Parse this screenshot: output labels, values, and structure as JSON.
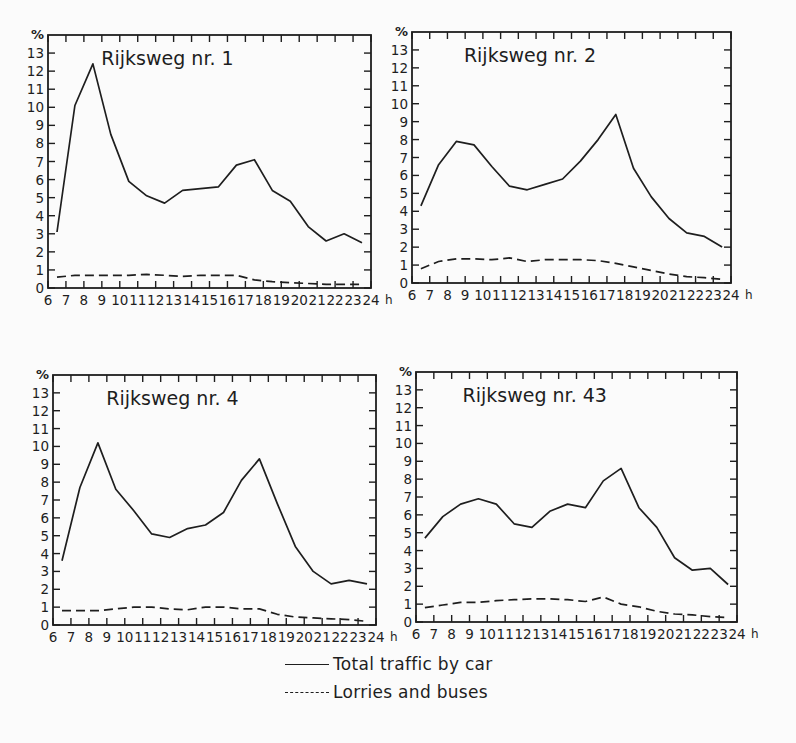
{
  "chart_data": [
    {
      "type": "line",
      "title": "Rijksweg nr. 1",
      "xlabel": "h",
      "ylabel": "%",
      "x_ticks": [
        6,
        7,
        8,
        9,
        10,
        11,
        12,
        13,
        14,
        15,
        16,
        17,
        18,
        19,
        20,
        21,
        22,
        23,
        24
      ],
      "y_ticks": [
        0,
        1,
        2,
        3,
        4,
        5,
        6,
        7,
        8,
        9,
        10,
        11,
        12,
        13
      ],
      "xlim": [
        6,
        24
      ],
      "ylim": [
        0,
        14
      ],
      "x": [
        6.5,
        7.5,
        8.5,
        9.5,
        10.5,
        11.5,
        12.5,
        13.5,
        14.5,
        15.5,
        16.5,
        17.5,
        18.5,
        19.5,
        20.5,
        21.5,
        22.5,
        23.5
      ],
      "series": [
        {
          "name": "Total traffic by car",
          "style": "solid",
          "values": [
            3.1,
            10.1,
            12.4,
            8.5,
            5.9,
            5.1,
            4.7,
            5.4,
            5.5,
            5.6,
            6.8,
            7.1,
            5.4,
            4.8,
            3.4,
            2.6,
            3.0,
            2.5
          ]
        },
        {
          "name": "Lorries and buses",
          "style": "dashed",
          "values": [
            0.6,
            0.7,
            0.7,
            0.7,
            0.7,
            0.75,
            0.7,
            0.65,
            0.7,
            0.7,
            0.7,
            0.45,
            0.35,
            0.3,
            0.25,
            0.2,
            0.2,
            0.2
          ]
        }
      ],
      "frame": {
        "left": 48,
        "top": 35,
        "right": 371,
        "bottom": 288
      }
    },
    {
      "type": "line",
      "title": "Rijksweg nr. 2",
      "xlabel": "h",
      "ylabel": "%",
      "x_ticks": [
        6,
        7,
        8,
        9,
        10,
        11,
        12,
        13,
        14,
        15,
        16,
        17,
        18,
        19,
        20,
        21,
        22,
        23,
        24
      ],
      "y_ticks": [
        0,
        1,
        2,
        3,
        4,
        5,
        6,
        7,
        8,
        9,
        10,
        11,
        12,
        13
      ],
      "xlim": [
        6,
        24
      ],
      "ylim": [
        0,
        14
      ],
      "x": [
        6.5,
        7.5,
        8.5,
        9.5,
        10.5,
        11.5,
        12.5,
        13.5,
        14.5,
        15.5,
        16.5,
        17.5,
        18.5,
        19.5,
        20.5,
        21.5,
        22.5,
        23.5
      ],
      "series": [
        {
          "name": "Total traffic by car",
          "style": "solid",
          "values": [
            4.3,
            6.6,
            7.9,
            7.7,
            6.5,
            5.4,
            5.2,
            5.5,
            5.8,
            6.8,
            8.0,
            9.4,
            6.4,
            4.8,
            3.6,
            2.8,
            2.6,
            2.0
          ]
        },
        {
          "name": "Lorries and buses",
          "style": "dashed",
          "values": [
            0.8,
            1.2,
            1.35,
            1.35,
            1.3,
            1.4,
            1.2,
            1.3,
            1.3,
            1.3,
            1.25,
            1.1,
            0.9,
            0.7,
            0.5,
            0.35,
            0.3,
            0.2
          ]
        }
      ],
      "frame": {
        "left": 412,
        "top": 32,
        "right": 731,
        "bottom": 283
      }
    },
    {
      "type": "line",
      "title": "Rijksweg nr. 4",
      "xlabel": "h",
      "ylabel": "%",
      "x_ticks": [
        6,
        7,
        8,
        9,
        10,
        11,
        12,
        13,
        14,
        15,
        16,
        17,
        18,
        19,
        20,
        21,
        22,
        23,
        24
      ],
      "y_ticks": [
        0,
        1,
        2,
        3,
        4,
        5,
        6,
        7,
        8,
        9,
        10,
        11,
        12,
        13
      ],
      "xlim": [
        6,
        24
      ],
      "ylim": [
        0,
        14
      ],
      "x": [
        6.5,
        7.5,
        8.5,
        9.5,
        10.5,
        11.5,
        12.5,
        13.5,
        14.5,
        15.5,
        16.5,
        17.5,
        18.5,
        19.5,
        20.5,
        21.5,
        22.5,
        23.5
      ],
      "series": [
        {
          "name": "Total traffic by car",
          "style": "solid",
          "values": [
            3.6,
            7.7,
            10.2,
            7.6,
            6.4,
            5.1,
            4.9,
            5.4,
            5.6,
            6.3,
            8.1,
            9.3,
            6.8,
            4.4,
            3.0,
            2.3,
            2.5,
            2.3
          ]
        },
        {
          "name": "Lorries and buses",
          "style": "dashed",
          "values": [
            0.8,
            0.8,
            0.8,
            0.9,
            1.0,
            1.0,
            0.9,
            0.85,
            1.0,
            1.0,
            0.9,
            0.9,
            0.6,
            0.45,
            0.4,
            0.35,
            0.3,
            0.2
          ]
        }
      ],
      "frame": {
        "left": 53,
        "top": 375,
        "right": 376,
        "bottom": 625
      }
    },
    {
      "type": "line",
      "title": "Rijksweg nr.  43",
      "xlabel": "h",
      "ylabel": "%",
      "x_ticks": [
        6,
        7,
        8,
        9,
        10,
        11,
        12,
        13,
        14,
        15,
        16,
        17,
        18,
        19,
        20,
        21,
        22,
        23,
        24
      ],
      "y_ticks": [
        0,
        1,
        2,
        3,
        4,
        5,
        6,
        7,
        8,
        9,
        10,
        11,
        12,
        13
      ],
      "xlim": [
        6,
        24
      ],
      "ylim": [
        0,
        14
      ],
      "x": [
        6.5,
        7.5,
        8.5,
        9.5,
        10.5,
        11.5,
        12.5,
        13.5,
        14.5,
        15.5,
        16.5,
        17.5,
        18.5,
        19.5,
        20.5,
        21.5,
        22.5,
        23.5
      ],
      "series": [
        {
          "name": "Total traffic by car",
          "style": "solid",
          "values": [
            4.7,
            5.9,
            6.6,
            6.9,
            6.6,
            5.5,
            5.3,
            6.2,
            6.6,
            6.4,
            7.9,
            8.6,
            6.4,
            5.3,
            3.6,
            2.9,
            3.0,
            2.1
          ]
        },
        {
          "name": "Lorries and buses",
          "style": "dashed",
          "values": [
            0.8,
            0.95,
            1.1,
            1.1,
            1.2,
            1.25,
            1.3,
            1.3,
            1.25,
            1.15,
            1.4,
            1.0,
            0.85,
            0.6,
            0.45,
            0.4,
            0.3,
            0.25
          ]
        }
      ],
      "frame": {
        "left": 416,
        "top": 372,
        "right": 737,
        "bottom": 622
      }
    }
  ],
  "legend": {
    "items": [
      {
        "label": "Total traffic by car",
        "style": "solid"
      },
      {
        "label": "Lorries and buses",
        "style": "dashed"
      }
    ]
  },
  "colors": {
    "ink": "#1e1e1e",
    "paper": "#fbfbfb"
  }
}
